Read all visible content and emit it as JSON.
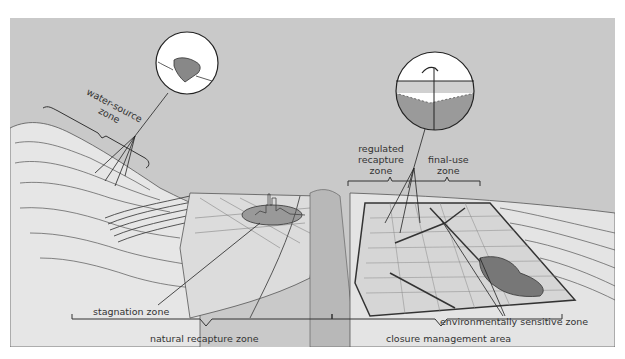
{
  "figure": {
    "background_color": "#c9c9c9",
    "labels": {
      "water_source_zone": "water-source zone",
      "water_source_line1": "water-source",
      "water_source_line2": "zone",
      "regulated_line1": "regulated",
      "regulated_line2": "recapture",
      "regulated_line3": "zone",
      "final_use_line1": "final-use",
      "final_use_line2": "zone",
      "stagnation_zone": "stagnation zone",
      "environmentally_sensitive_zone": "environmentally sensitive zone",
      "natural_recapture_zone": "natural recapture zone",
      "closure_management_area": "closure management area"
    },
    "insets": [
      {
        "name": "water-source-inset",
        "depicts": "pond / reservoir with stream"
      },
      {
        "name": "groundwater-well-inset",
        "depicts": "hand pump over water table and aquifer"
      }
    ]
  }
}
